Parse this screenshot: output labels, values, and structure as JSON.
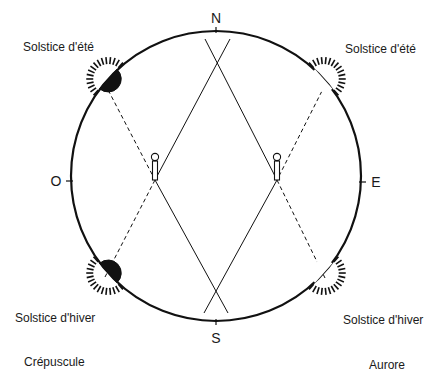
{
  "cardinals": {
    "north": "N",
    "south": "S",
    "east": "E",
    "west": "O"
  },
  "suns": {
    "summer_west": {
      "label": "Solstice d'été",
      "style": "filled"
    },
    "summer_east": {
      "label": "Solstice d'été",
      "style": "outline"
    },
    "winter_west": {
      "label": "Solstice d'hiver",
      "style": "filled"
    },
    "winter_east": {
      "label": "Solstice d'hiver",
      "style": "outline"
    }
  },
  "captions": {
    "west": "Crépuscule",
    "east": "Aurore"
  },
  "markers": [
    {
      "name": "west-marker"
    },
    {
      "name": "east-marker"
    }
  ],
  "colors": {
    "ink": "#111111",
    "background": "#ffffff"
  }
}
